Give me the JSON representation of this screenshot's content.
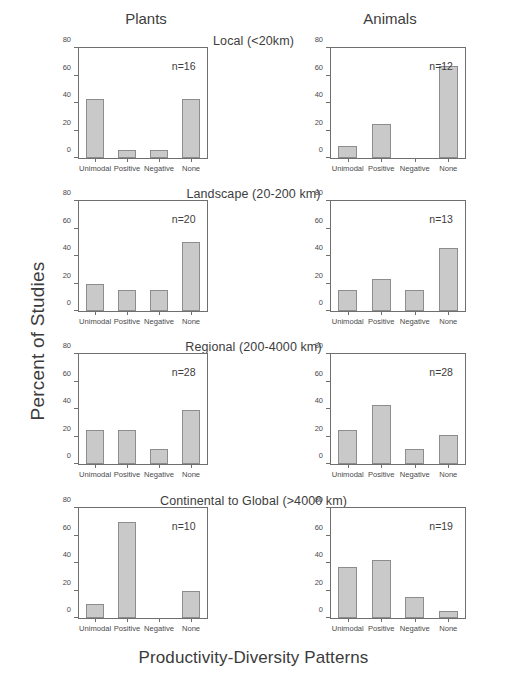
{
  "figure": {
    "ylabel": "Percent of Studies",
    "xlabel": "Productivity-Diversity Patterns",
    "columns": [
      {
        "id": "plants",
        "label": "Plants"
      },
      {
        "id": "animals",
        "label": "Animals"
      }
    ],
    "bands": [
      {
        "id": "local",
        "label": "Local (<20km)"
      },
      {
        "id": "landscape",
        "label": "Landscape (20-200 km)"
      },
      {
        "id": "regional",
        "label": "Regional (200-4000 km)"
      },
      {
        "id": "continental",
        "label": "Continental to Global (>4000 km)"
      }
    ],
    "bar_color": "#c9c9c9",
    "bar_edge_color": "#8d8d8d",
    "axis_color": "#6f6f6f"
  },
  "chart_data": {
    "type": "bar",
    "title": "",
    "xlabel": "Productivity-Diversity Patterns",
    "ylabel": "Percent of Studies",
    "ylim": [
      0,
      80
    ],
    "yticks": [
      0,
      20,
      40,
      60,
      80
    ],
    "ytick_labels": [
      "0",
      "20",
      "40",
      "60",
      "80"
    ],
    "categories": [
      "Unimodal",
      "Positive",
      "Negative",
      "None"
    ],
    "grid": false,
    "legend": "none",
    "panels": [
      {
        "id": "plants-local",
        "column": "Plants",
        "band": "Local (<20km)",
        "n_label": "n=16",
        "n": 16,
        "values": [
          43,
          6,
          6,
          43
        ]
      },
      {
        "id": "animals-local",
        "column": "Animals",
        "band": "Local (<20km)",
        "n_label": "n=12",
        "n": 12,
        "values": [
          9,
          25,
          0,
          67
        ]
      },
      {
        "id": "plants-landscape",
        "column": "Plants",
        "band": "Landscape (20-200 km)",
        "n_label": "n=20",
        "n": 20,
        "values": [
          20,
          15,
          15,
          50
        ]
      },
      {
        "id": "animals-landscape",
        "column": "Animals",
        "band": "Landscape (20-200 km)",
        "n_label": "n=13",
        "n": 13,
        "values": [
          15,
          23,
          15,
          46
        ]
      },
      {
        "id": "plants-regional",
        "column": "Plants",
        "band": "Regional (200-4000 km)",
        "n_label": "n=28",
        "n": 28,
        "values": [
          25,
          25,
          11,
          39
        ]
      },
      {
        "id": "animals-regional",
        "column": "Animals",
        "band": "Regional (200-4000 km)",
        "n_label": "n=28",
        "n": 28,
        "values": [
          25,
          43,
          11,
          21
        ]
      },
      {
        "id": "plants-continental",
        "column": "Plants",
        "band": "Continental to Global (>4000 km)",
        "n_label": "n=10",
        "n": 10,
        "values": [
          10,
          70,
          0,
          20
        ]
      },
      {
        "id": "animals-continental",
        "column": "Animals",
        "band": "Continental to Global (>4000 km)",
        "n_label": "n=19",
        "n": 19,
        "values": [
          37,
          42,
          15,
          5
        ]
      }
    ]
  },
  "layout": {
    "panel_boxes": [
      {
        "left": 36,
        "top": 47,
        "width": 172,
        "height": 134
      },
      {
        "left": 288,
        "top": 47,
        "width": 178,
        "height": 134
      },
      {
        "left": 36,
        "top": 200,
        "width": 172,
        "height": 134
      },
      {
        "left": 288,
        "top": 200,
        "width": 178,
        "height": 134
      },
      {
        "left": 36,
        "top": 353,
        "width": 172,
        "height": 134
      },
      {
        "left": 288,
        "top": 353,
        "width": 178,
        "height": 134
      },
      {
        "left": 36,
        "top": 507,
        "width": 172,
        "height": 134
      },
      {
        "left": 288,
        "top": 507,
        "width": 178,
        "height": 134
      }
    ],
    "band_title_tops": [
      34,
      187,
      340,
      494
    ]
  }
}
